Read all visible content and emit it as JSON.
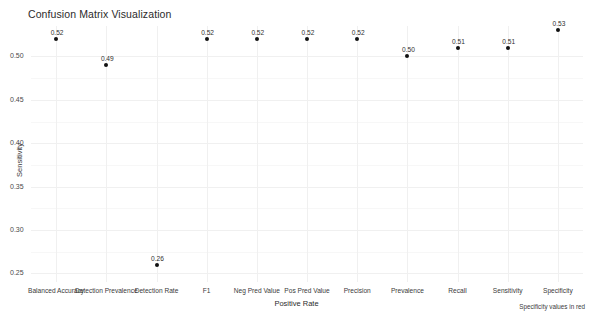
{
  "chart_data": {
    "type": "scatter",
    "title": "Confusion Matrix Visualization",
    "xlabel": "Positive Rate",
    "ylabel": "Sensitivity",
    "categories": [
      "Balanced Accuracy",
      "Detection Prevalence",
      "Detection Rate",
      "F1",
      "Neg Pred Value",
      "Pos Pred Value",
      "Precision",
      "Prevalence",
      "Recall",
      "Sensitivity",
      "Specificity"
    ],
    "values": [
      0.52,
      0.49,
      0.26,
      0.52,
      0.52,
      0.52,
      0.52,
      0.5,
      0.51,
      0.51,
      0.53
    ],
    "point_labels": [
      "0.52",
      "0.49",
      "0.26",
      "0.52",
      "0.52",
      "0.52",
      "0.52",
      "0.50",
      "0.51",
      "0.51",
      "0.53"
    ],
    "ylim": [
      0.24,
      0.535
    ],
    "yticks": [
      0.5,
      0.45,
      0.4,
      0.35,
      0.3,
      0.25
    ],
    "ytick_labels": [
      "0.50",
      "0.45",
      "0.40",
      "0.35",
      "0.30",
      "0.25"
    ],
    "grid": true,
    "legend": "none",
    "annotation": "Specificity values in red",
    "point_color": "#111111",
    "grid_color": "#f0f0f0",
    "background": "#ffffff"
  }
}
